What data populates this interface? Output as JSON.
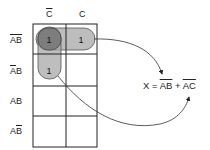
{
  "kmap": {
    "columns": [
      {
        "label": "C",
        "overline": true
      },
      {
        "label": "C",
        "overline": false
      }
    ],
    "rows": [
      {
        "label_parts": [
          {
            "t": "A",
            "o": true
          },
          {
            "t": "B",
            "o": true
          }
        ]
      },
      {
        "label_parts": [
          {
            "t": "A",
            "o": true
          },
          {
            "t": "B",
            "o": false
          }
        ]
      },
      {
        "label_parts": [
          {
            "t": "A",
            "o": false
          },
          {
            "t": "B",
            "o": false
          }
        ]
      },
      {
        "label_parts": [
          {
            "t": "A",
            "o": false
          },
          {
            "t": "B",
            "o": true
          }
        ]
      }
    ],
    "cells": [
      [
        "1",
        "1"
      ],
      [
        "1",
        ""
      ],
      [
        "",
        ""
      ],
      [
        "",
        ""
      ]
    ],
    "groups": [
      {
        "name": "A'B' group",
        "cells": [
          [
            0,
            0
          ],
          [
            0,
            1
          ]
        ],
        "color": "#b4b4b4"
      },
      {
        "name": "A'C' group",
        "cells": [
          [
            0,
            0
          ],
          [
            1,
            0
          ]
        ],
        "color": "#9a9a9a"
      }
    ]
  },
  "equation": {
    "lhs": "X",
    "equals": "=",
    "term1": "AB",
    "plus": "+",
    "term2": "AC"
  },
  "labels": {
    "col0": "C",
    "col1": "C",
    "row0_a": "A",
    "row0_b": "B",
    "row1_a": "A",
    "row1_b": "B",
    "row2_a": "A",
    "row2_b": "B",
    "row3_a": "A",
    "row3_b": "B"
  }
}
